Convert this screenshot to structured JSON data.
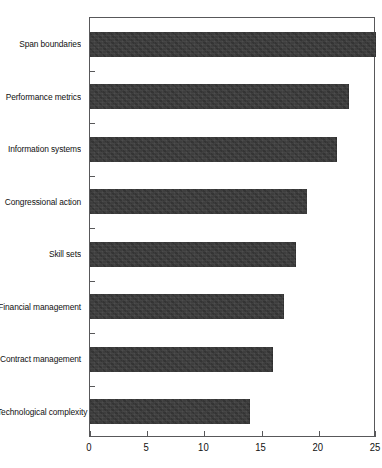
{
  "chart_data": {
    "type": "bar",
    "orientation": "horizontal",
    "title": "",
    "subtitle": "",
    "xlabel": "",
    "ylabel": "",
    "xlim": [
      0,
      25
    ],
    "xticks": [
      0,
      5,
      10,
      15,
      20,
      25
    ],
    "xtick_labels": [
      "0",
      "5",
      "10",
      "15",
      "20",
      "25"
    ],
    "grid": false,
    "legend": null,
    "categories": [
      "Span boundaries",
      "Performance metrics",
      "Information systems",
      "Congressional action",
      "Skill sets",
      "Financial management",
      "Contract management",
      "Technological complexity"
    ],
    "values": [
      25,
      22.6,
      21.6,
      19,
      18,
      17,
      16,
      14
    ],
    "bar_color": "#3a3a3a",
    "frame_color": "#58585a",
    "background_color": "#ffffff"
  }
}
